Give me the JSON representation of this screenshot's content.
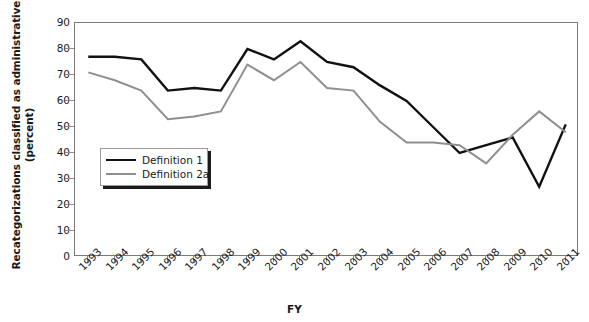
{
  "chart_data": {
    "type": "line",
    "title": "",
    "xlabel": "FY",
    "ylabel": "Recategorizations classified as administrative (percent)",
    "ylabel_line1": "Recategorizations classified as administrative",
    "ylabel_line2": "(percent)",
    "categories": [
      "1993",
      "1994",
      "1995",
      "1996",
      "1997",
      "1998",
      "1999",
      "2000",
      "2001",
      "2002",
      "2003",
      "2004",
      "2005",
      "2006",
      "2007",
      "2008",
      "2009",
      "2010",
      "2011"
    ],
    "x": [
      1993,
      1994,
      1995,
      1996,
      1997,
      1998,
      1999,
      2000,
      2001,
      2002,
      2003,
      2004,
      2005,
      2006,
      2007,
      2008,
      2009,
      2010,
      2011
    ],
    "ylim": [
      0,
      90
    ],
    "yticks": [
      0,
      10,
      20,
      30,
      40,
      50,
      60,
      70,
      80,
      90
    ],
    "ytick_labels": [
      "0",
      "10",
      "20",
      "30",
      "40",
      "50",
      "60",
      "70",
      "80",
      "90"
    ],
    "grid": false,
    "legend_position": "inside-left",
    "series": [
      {
        "name": "Definition 1",
        "color": "#111111",
        "values": [
          77,
          77,
          76,
          64,
          65,
          64,
          80,
          76,
          83,
          75,
          73,
          66,
          60,
          50,
          40,
          43,
          46,
          27,
          51
        ]
      },
      {
        "name": "Definition 2a",
        "color": "#8f8f8f",
        "values": [
          71,
          68,
          64,
          53,
          54,
          56,
          74,
          68,
          75,
          65,
          64,
          52,
          44,
          44,
          43,
          36,
          47,
          56,
          48
        ]
      }
    ]
  },
  "axes": {
    "x_title": "FY",
    "y_title_line1": "Recategorizations classified as administrative",
    "y_title_line2": "(percent)"
  },
  "legend": {
    "items": [
      {
        "label": "Definition 1"
      },
      {
        "label": "Definition 2a"
      }
    ]
  }
}
